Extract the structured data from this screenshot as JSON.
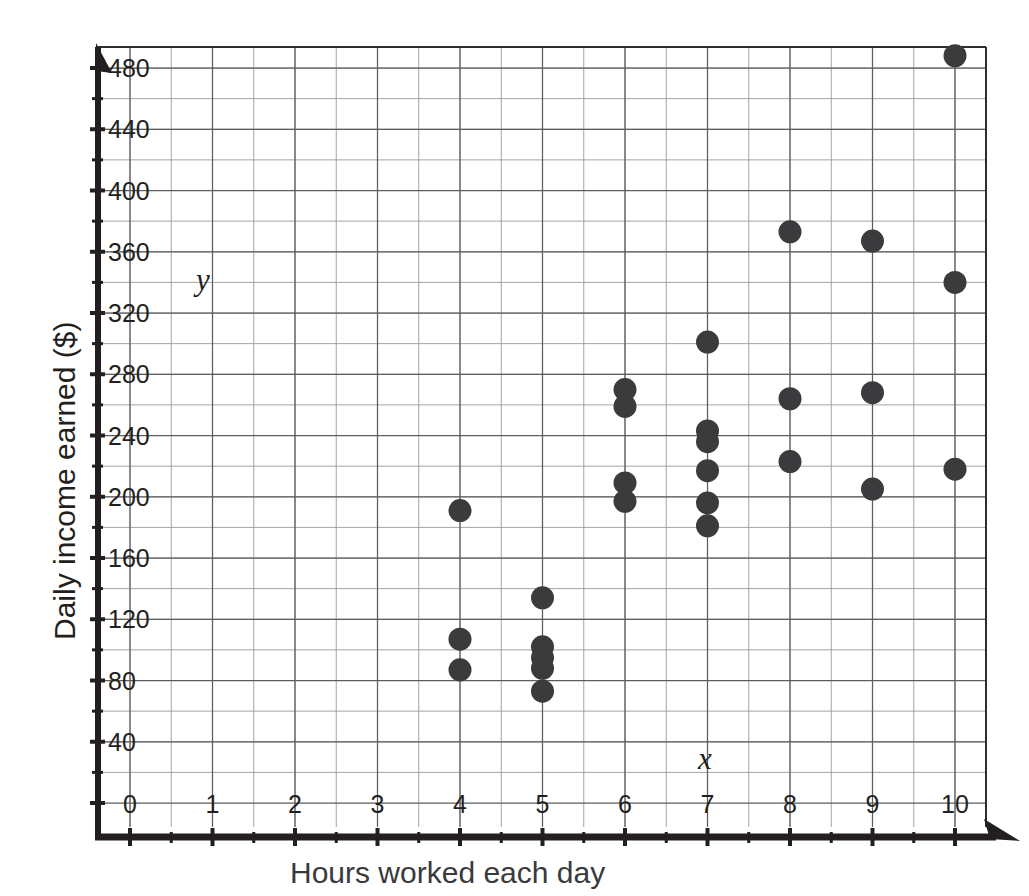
{
  "chart_data": {
    "type": "scatter",
    "title": "",
    "xlabel": "Hours worked each day",
    "ylabel": "Daily income earned ($)",
    "xlim": [
      0,
      10.6
    ],
    "ylim": [
      0,
      500
    ],
    "grid": true,
    "x_major_ticks": [
      0,
      1,
      2,
      3,
      4,
      5,
      6,
      7,
      8,
      9,
      10
    ],
    "x_tick_labels": [
      "0",
      "1",
      "2",
      "3",
      "4",
      "5",
      "6",
      "7",
      "8",
      "9",
      "10"
    ],
    "x_minor_step": 0.5,
    "y_major_ticks": [
      40,
      80,
      120,
      160,
      200,
      240,
      280,
      320,
      360,
      400,
      440,
      480
    ],
    "y_tick_labels": [
      "40",
      "80",
      "120",
      "160",
      "200",
      "240",
      "280",
      "320",
      "360",
      "400",
      "440",
      "480"
    ],
    "y_minor_step": 20,
    "axis_variable_x": "x",
    "axis_variable_y": "y",
    "marker": "filled-circle",
    "marker_color": "#3b3b3d",
    "legend": "none",
    "points": [
      {
        "x": 4,
        "y": 191
      },
      {
        "x": 4,
        "y": 107
      },
      {
        "x": 4,
        "y": 87
      },
      {
        "x": 5,
        "y": 134
      },
      {
        "x": 5,
        "y": 102
      },
      {
        "x": 5,
        "y": 95
      },
      {
        "x": 5,
        "y": 88
      },
      {
        "x": 5,
        "y": 73
      },
      {
        "x": 6,
        "y": 270
      },
      {
        "x": 6,
        "y": 259
      },
      {
        "x": 6,
        "y": 209
      },
      {
        "x": 6,
        "y": 197
      },
      {
        "x": 7,
        "y": 301
      },
      {
        "x": 7,
        "y": 243
      },
      {
        "x": 7,
        "y": 236
      },
      {
        "x": 7,
        "y": 217
      },
      {
        "x": 7,
        "y": 196
      },
      {
        "x": 7,
        "y": 181
      },
      {
        "x": 8,
        "y": 373
      },
      {
        "x": 8,
        "y": 264
      },
      {
        "x": 8,
        "y": 223
      },
      {
        "x": 9,
        "y": 367
      },
      {
        "x": 9,
        "y": 268
      },
      {
        "x": 9,
        "y": 205
      },
      {
        "x": 10,
        "y": 488
      },
      {
        "x": 10,
        "y": 340
      },
      {
        "x": 10,
        "y": 218
      }
    ]
  }
}
